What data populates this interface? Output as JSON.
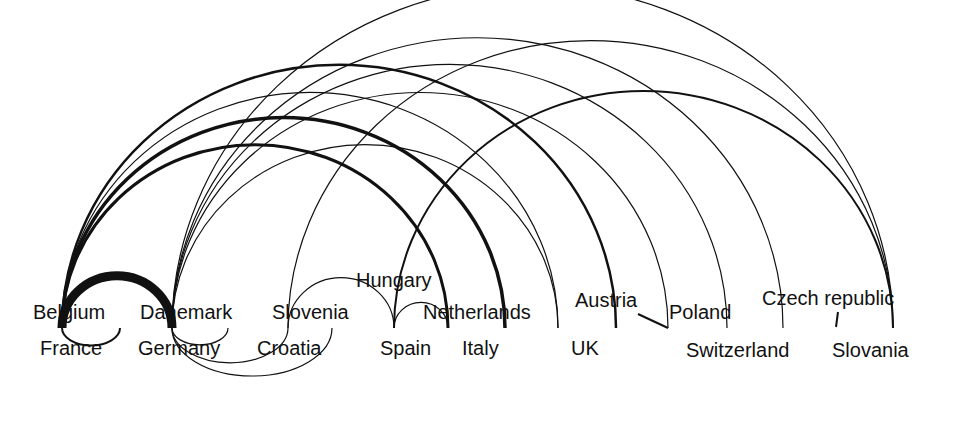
{
  "diagram": {
    "type": "arc-diagram",
    "background": "#ffffff",
    "stroke_color": "#111111",
    "nodes": [
      {
        "id": "belgium",
        "label": "Belgium",
        "x": 33,
        "y": 302,
        "anchor_x": 62
      },
      {
        "id": "france",
        "label": "France",
        "x": 40,
        "y": 338,
        "anchor_x": 62
      },
      {
        "id": "danemark",
        "label": "Danemark",
        "x": 140,
        "y": 302,
        "anchor_x": 172
      },
      {
        "id": "germany",
        "label": "Germany",
        "x": 138,
        "y": 338,
        "anchor_x": 172
      },
      {
        "id": "slovenia",
        "label": "Slovenia",
        "x": 272,
        "y": 302,
        "anchor_x": 288
      },
      {
        "id": "croatia",
        "label": "Croatia",
        "x": 257,
        "y": 338,
        "anchor_x": 332
      },
      {
        "id": "hungary",
        "label": "Hungary",
        "x": 356,
        "y": 270,
        "anchor_x": 394
      },
      {
        "id": "spain",
        "label": "Spain",
        "x": 380,
        "y": 338,
        "anchor_x": 394
      },
      {
        "id": "netherlands",
        "label": "Netherlands",
        "x": 423,
        "y": 302,
        "anchor_x": 505
      },
      {
        "id": "italy",
        "label": "Italy",
        "x": 462,
        "y": 338,
        "anchor_x": 448
      },
      {
        "id": "uk",
        "label": "UK",
        "x": 571,
        "y": 338,
        "anchor_x": 558
      },
      {
        "id": "austria",
        "label": "Austria",
        "x": 575,
        "y": 290,
        "anchor_x": 616
      },
      {
        "id": "poland",
        "label": "Poland",
        "x": 669,
        "y": 302,
        "anchor_x": 668
      },
      {
        "id": "switzerland",
        "label": "Switzerland",
        "x": 686,
        "y": 340,
        "anchor_x": 727
      },
      {
        "id": "czech",
        "label": "Czech republic",
        "x": 762,
        "y": 288,
        "anchor_x": 783
      },
      {
        "id": "slovania",
        "label": "Slovania",
        "x": 832,
        "y": 340,
        "anchor_x": 838
      }
    ],
    "upper_arcs": [
      {
        "x1": 62,
        "x2": 172,
        "width": 9
      },
      {
        "x1": 62,
        "x2": 448,
        "width": 3
      },
      {
        "x1": 62,
        "x2": 505,
        "width": 3.5
      },
      {
        "x1": 62,
        "x2": 558,
        "width": 1.2
      },
      {
        "x1": 62,
        "x2": 616,
        "width": 2.5
      },
      {
        "x1": 172,
        "x2": 727,
        "width": 1.2
      },
      {
        "x1": 172,
        "x2": 783,
        "width": 1.2
      },
      {
        "x1": 172,
        "x2": 893,
        "width": 1.2
      },
      {
        "x1": 172,
        "x2": 668,
        "width": 1.2
      },
      {
        "x1": 172,
        "x2": 558,
        "width": 1.2
      },
      {
        "x1": 288,
        "x2": 893,
        "width": 1.2
      },
      {
        "x1": 288,
        "x2": 394,
        "width": 1.2
      },
      {
        "x1": 394,
        "x2": 893,
        "width": 2
      },
      {
        "x1": 394,
        "x2": 448,
        "width": 1.2
      }
    ],
    "lower_arcs": [
      {
        "x1": 62,
        "x2": 120,
        "width": 2
      },
      {
        "x1": 172,
        "x2": 228,
        "width": 1.2
      },
      {
        "x1": 172,
        "x2": 288,
        "width": 1.2
      },
      {
        "x1": 172,
        "x2": 332,
        "width": 1.2
      }
    ],
    "short_links": [
      {
        "x1": 638,
        "y1": 314,
        "x2": 668,
        "y2": 328,
        "width": 2
      },
      {
        "x1": 838,
        "y1": 312,
        "x2": 836,
        "y2": 327,
        "width": 2
      }
    ],
    "baseline_y": 328
  }
}
